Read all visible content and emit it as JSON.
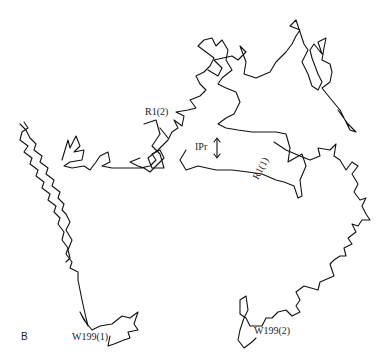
{
  "figure": {
    "panel_label": "B",
    "labels": {
      "r1_2": "R1(2)",
      "r1_1": "R1(1)",
      "ipr": "IPr",
      "w199_1": "W199(1)",
      "w199_2": "W199(2)"
    },
    "colors": {
      "stroke": "#111111",
      "background": "#ffffff"
    }
  }
}
